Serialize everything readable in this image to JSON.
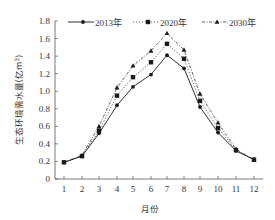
{
  "chart_data": {
    "type": "line",
    "title": "",
    "xlabel": "月份",
    "ylabel": "生态环境需水量(亿m³)",
    "ylabel_main": "生态环境需水量(亿m",
    "ylabel_sup": "3",
    "ylabel_close": ")",
    "ylim": [
      0,
      1.8
    ],
    "yticks": [
      "0",
      "0.2",
      "0.4",
      "0.6",
      "0.8",
      "1.0",
      "1.2",
      "1.4",
      "1.6",
      "1.8"
    ],
    "categories": [
      "1",
      "2",
      "3",
      "4",
      "5",
      "6",
      "7",
      "8",
      "9",
      "10",
      "11",
      "12"
    ],
    "grid": false,
    "legend_position": "top",
    "series": [
      {
        "name": "2013年",
        "marker": "circle",
        "line": "solid",
        "values": [
          0.19,
          0.26,
          0.52,
          0.84,
          1.05,
          1.19,
          1.41,
          1.26,
          0.82,
          0.53,
          0.32,
          0.22
        ]
      },
      {
        "name": "2020年",
        "marker": "square",
        "line": "dotted",
        "values": [
          0.19,
          0.26,
          0.55,
          0.95,
          1.16,
          1.33,
          1.54,
          1.37,
          0.89,
          0.58,
          0.33,
          0.22
        ]
      },
      {
        "name": "2030年",
        "marker": "triangle",
        "line": "dashdot",
        "values": [
          0.19,
          0.27,
          0.6,
          1.04,
          1.29,
          1.46,
          1.66,
          1.47,
          0.97,
          0.64,
          0.34,
          0.22
        ]
      }
    ]
  },
  "colors": {
    "line": "#1a1a1a",
    "axis": "#555555",
    "text": "#333333"
  }
}
